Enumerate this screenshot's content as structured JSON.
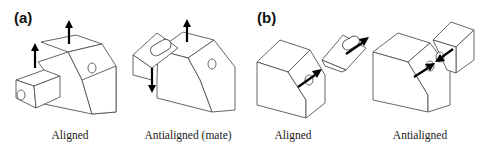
{
  "figure": {
    "panels": [
      {
        "id": "a",
        "label": "(a)",
        "subfigures": [
          {
            "caption": "Aligned",
            "arrows": "both up (parallel)"
          },
          {
            "caption": "Antialigned (mate)",
            "arrows": "one up, one down (opposite)"
          }
        ]
      },
      {
        "id": "b",
        "label": "(b)",
        "subfigures": [
          {
            "caption": "Aligned",
            "arrows": "both pointing same diagonal direction"
          },
          {
            "caption": "Antialigned",
            "arrows": "pointing toward each other"
          }
        ]
      }
    ],
    "colors": {
      "edge": "#555555",
      "arrow": "#000000",
      "background": "#ffffff"
    }
  }
}
